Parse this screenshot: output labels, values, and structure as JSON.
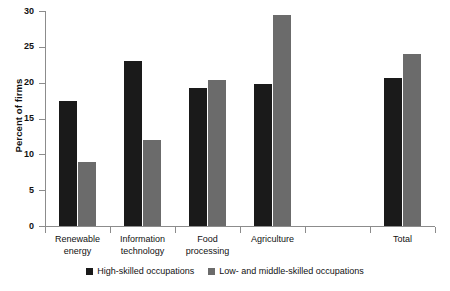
{
  "chart_data": {
    "type": "bar",
    "title": "",
    "xlabel": "",
    "ylabel": "Percent of firms",
    "ylim": [
      0,
      30
    ],
    "yticks": [
      0,
      5,
      10,
      15,
      20,
      25,
      30
    ],
    "grid": false,
    "legend_position": "bottom",
    "categories": [
      "Renewable energy",
      "Information technology",
      "Food processing",
      "Agriculture",
      "",
      "Total"
    ],
    "category_lines": [
      [
        "Renewable",
        "energy"
      ],
      [
        "Information",
        "technology"
      ],
      [
        "Food",
        "processing"
      ],
      [
        "Agriculture"
      ],
      [
        ""
      ],
      [
        "Total"
      ]
    ],
    "series": [
      {
        "name": "High-skilled occupations",
        "color": "#1a1a1a",
        "values": [
          17.5,
          23.0,
          19.3,
          19.8,
          null,
          20.7
        ]
      },
      {
        "name": "Low- and middle-skilled occupations",
        "color": "#6b6b6b",
        "values": [
          9.0,
          12.0,
          20.4,
          29.4,
          null,
          24.0
        ]
      }
    ]
  },
  "legend": {
    "items": [
      {
        "label": "High-skilled occupations",
        "swatch": "dark-square-icon"
      },
      {
        "label": "Low- and middle-skilled occupations",
        "swatch": "gray-square-icon"
      }
    ]
  },
  "axis": {
    "y_title": "Percent of firms",
    "y_tick_labels": [
      "0",
      "5",
      "10",
      "15",
      "20",
      "25",
      "30"
    ]
  }
}
